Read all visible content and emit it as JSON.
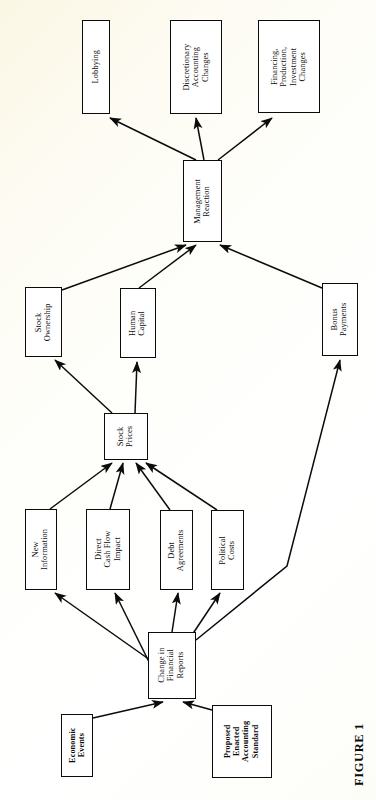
{
  "figure": {
    "caption": "FIGURE 1",
    "orientation": "rotated-90-ccw",
    "background_color": "#fdfcf4",
    "line_color": "#0b0b0b",
    "box_fill": "#ffffff"
  },
  "nodes": [
    {
      "id": "lobbying",
      "label": "Lobbying",
      "x": 82,
      "y": 20,
      "w": 28,
      "h": 94,
      "bold": false
    },
    {
      "id": "discretionary",
      "label": "Discretionary\nAccounting\nChanges",
      "x": 170,
      "y": 20,
      "w": 52,
      "h": 94,
      "bold": false
    },
    {
      "id": "financing",
      "label": "Financing,\nProduction,\nInvestment\nChanges",
      "x": 258,
      "y": 20,
      "w": 62,
      "h": 93,
      "bold": false
    },
    {
      "id": "management",
      "label": "Management\nReaction",
      "x": 183,
      "y": 160,
      "w": 39,
      "h": 82,
      "bold": false
    },
    {
      "id": "stock-ownership",
      "label": "Stock\nOwnership",
      "x": 25,
      "y": 287,
      "w": 37,
      "h": 70,
      "bold": false
    },
    {
      "id": "human-capital",
      "label": "Human\nCapital",
      "x": 120,
      "y": 288,
      "w": 36,
      "h": 70,
      "bold": false
    },
    {
      "id": "bonus-payments",
      "label": "Bonus\nPayments",
      "x": 322,
      "y": 283,
      "w": 36,
      "h": 73,
      "bold": false
    },
    {
      "id": "stock-prices",
      "label": "Stock\nPrices",
      "x": 104,
      "y": 413,
      "w": 44,
      "h": 47,
      "bold": false
    },
    {
      "id": "new-information",
      "label": "New\nInformation",
      "x": 25,
      "y": 509,
      "w": 32,
      "h": 81,
      "bold": false
    },
    {
      "id": "cash-flow",
      "label": "Direct\nCash Flow\nImpact",
      "x": 86,
      "y": 509,
      "w": 44,
      "h": 81,
      "bold": false
    },
    {
      "id": "debt-agreements",
      "label": "Debt\nAgreements",
      "x": 160,
      "y": 510,
      "w": 33,
      "h": 80,
      "bold": false
    },
    {
      "id": "political-costs",
      "label": "Political\nCosts",
      "x": 211,
      "y": 510,
      "w": 33,
      "h": 80,
      "bold": false
    },
    {
      "id": "change-reports",
      "label": "Change in\nFinancial\nReports",
      "x": 148,
      "y": 632,
      "w": 48,
      "h": 67,
      "bold": false
    },
    {
      "id": "economic-events",
      "label": "Economic\nEvents",
      "x": 61,
      "y": 714,
      "w": 32,
      "h": 63,
      "bold": true
    },
    {
      "id": "standard",
      "label": "Proposed\nEnacted\nAccounting\nStandard",
      "x": 212,
      "y": 705,
      "w": 60,
      "h": 73,
      "bold": true
    }
  ],
  "edges": [
    {
      "from": "management",
      "to": "lobbying",
      "path": "M 196 160 L 110 118"
    },
    {
      "from": "management",
      "to": "discretionary",
      "path": "M 204 160 L 196 118"
    },
    {
      "from": "management",
      "to": "financing",
      "path": "M 218 160 L 272 118"
    },
    {
      "from": "stock-ownership",
      "to": "management",
      "path": "M 62 290 L 186 245"
    },
    {
      "from": "human-capital",
      "to": "management",
      "path": "M 139 288 L 196 245"
    },
    {
      "from": "bonus-payments",
      "to": "management",
      "path": "M 322 288 L 220 245"
    },
    {
      "from": "stock-prices",
      "to": "stock-ownership",
      "path": "M 112 413 L 55 360"
    },
    {
      "from": "stock-prices",
      "to": "human-capital",
      "path": "M 135 413 L 137 362"
    },
    {
      "from": "new-information",
      "to": "stock-prices",
      "path": "M 50 509 L 112 463"
    },
    {
      "from": "cash-flow",
      "to": "stock-prices",
      "path": "M 110 509 L 123 463"
    },
    {
      "from": "debt-agreements",
      "to": "stock-prices",
      "path": "M 170 510 L 136 463"
    },
    {
      "from": "political-costs",
      "to": "stock-prices",
      "path": "M 217 510 L 146 463"
    },
    {
      "from": "change-reports",
      "to": "new-information",
      "path": "M 150 660 L 55 593"
    },
    {
      "from": "change-reports",
      "to": "cash-flow",
      "path": "M 152 668 L 115 593"
    },
    {
      "from": "change-reports",
      "to": "debt-agreements",
      "path": "M 172 632 L 178 593"
    },
    {
      "from": "change-reports",
      "to": "political-costs",
      "path": "M 192 635 L 220 593"
    },
    {
      "from": "change-reports",
      "to": "bonus-payments",
      "path": "M 196 640 L 287 566 L 340 360"
    },
    {
      "from": "economic-events",
      "to": "change-reports",
      "path": "M 93 718 L 163 702"
    },
    {
      "from": "standard",
      "to": "change-reports",
      "path": "M 212 710 L 183 702"
    }
  ]
}
